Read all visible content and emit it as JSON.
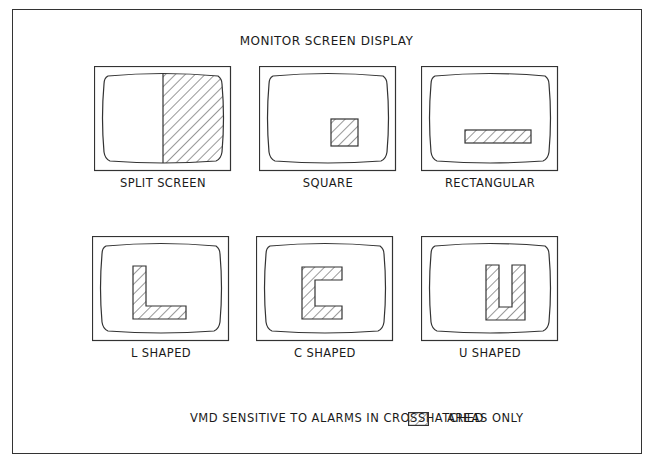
{
  "diagram": {
    "title": "MONITOR SCREEN DISPLAY",
    "monitors": [
      {
        "label": "SPLIT SCREEN",
        "shape": "split-screen"
      },
      {
        "label": "SQUARE",
        "shape": "square"
      },
      {
        "label": "RECTANGULAR",
        "shape": "rectangular"
      },
      {
        "label": "L SHAPED",
        "shape": "l-shaped"
      },
      {
        "label": "C SHAPED",
        "shape": "c-shaped"
      },
      {
        "label": "U SHAPED",
        "shape": "u-shaped"
      }
    ],
    "legend": {
      "text_before": "VMD SENSITIVE TO ALARMS IN CROSSHATCHED",
      "swatch": "crosshatch-swatch",
      "text_after": "AREAS ONLY"
    },
    "colors": {
      "line": "#333333",
      "background": "#ffffff"
    }
  }
}
